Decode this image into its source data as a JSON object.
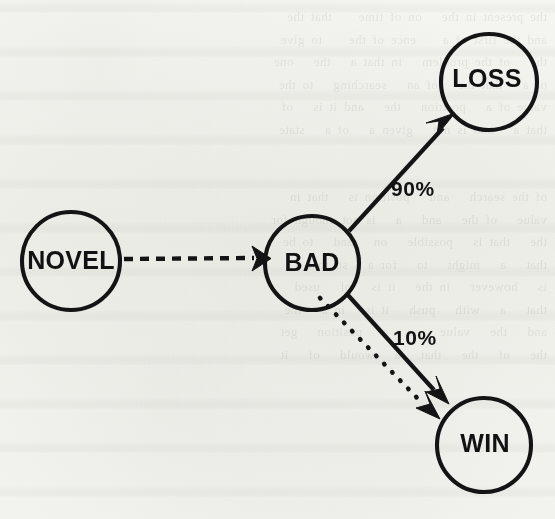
{
  "document": {
    "kind": "scanned-figure",
    "medium": "photocopied book page",
    "paper_color": "#fbfbf9",
    "ink_color": "#141414",
    "bleed_through_opacity": "0.085"
  },
  "diagram": {
    "type": "state-transition-graph",
    "nodes": [
      {
        "id": "novel",
        "label": "NOVEL",
        "cx": 71,
        "cy": 261,
        "r": 49
      },
      {
        "id": "bad",
        "label": "BAD",
        "cx": 312,
        "cy": 263,
        "r": 47
      },
      {
        "id": "loss",
        "label": "LOSS",
        "cx": 489,
        "cy": 82,
        "r": 48
      },
      {
        "id": "win",
        "label": "WIN",
        "cx": 484,
        "cy": 445,
        "r": 47
      }
    ],
    "edges": [
      {
        "id": "novel-to-bad",
        "from": "NOVEL",
        "to": "BAD",
        "style": "dashed",
        "label": "",
        "arrowhead": true
      },
      {
        "id": "bad-to-loss",
        "from": "BAD",
        "to": "LOSS",
        "style": "solid",
        "label": "90%",
        "arrowhead": true
      },
      {
        "id": "bad-to-win-solid",
        "from": "BAD",
        "to": "WIN",
        "style": "solid",
        "label": "10%",
        "arrowhead": true
      },
      {
        "id": "bad-to-win-dotted",
        "from": "BAD",
        "to": "WIN",
        "style": "dotted",
        "label": "",
        "arrowhead": true
      }
    ],
    "labels": {
      "loss_probability": "90%",
      "win_probability": "10%"
    }
  },
  "background_ghost_text": "the present in the   on of time    that the\nand the first of a    ence of the    to give\nthe   of the problem   in that a   the   one\nof a   that the   of an   searching   to the\nvalue of a   position   the   and it is   of\nthat a   and is not   given a   of a   state\n\n\nof the search   and   position is   that in\nvalue   of the   and   a   is not enough for\nthe   that is   possible   on   and   to be\nthat   a   might   to   for a   so that a\nis   however   in the   it is   of   used\nthat   a   with   push   it is   in a   the\nand   the   value   as   a   position   get\nthe   of   the   that   a   would   of   it"
}
